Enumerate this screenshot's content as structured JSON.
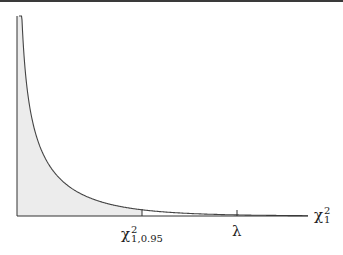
{
  "figure": {
    "type": "density-plot",
    "title": "",
    "curve": "chi-squared density, 1 degree of freedom",
    "shaded_region": "area under curve from 0 to critical value",
    "colors": {
      "curve": "#444444",
      "axes": "#333333",
      "shade": "#ececec",
      "background": "#ffffff"
    }
  },
  "axes": {
    "x_label_symbol": "χ",
    "x_label_sup": "2",
    "x_label_sub": "1",
    "ticks": [
      {
        "id": "critical",
        "symbol": "χ",
        "sup": "2",
        "sub": "1,0.95",
        "x_px": 142
      },
      {
        "id": "lambda",
        "symbol": "λ",
        "x_px": 237
      }
    ]
  }
}
